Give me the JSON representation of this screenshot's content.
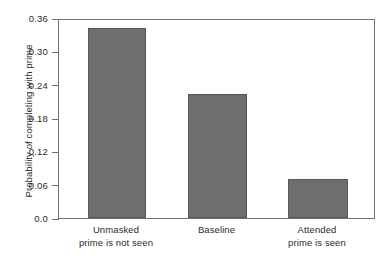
{
  "chart_data": {
    "type": "bar",
    "title": "",
    "xlabel": "",
    "ylabel": "Probability of completing with prime",
    "categories": [
      "Unmasked prime is not seen",
      "Baseline",
      "Attended prime is seen"
    ],
    "category_lines": [
      [
        "Unmasked",
        "prime is not seen"
      ],
      [
        "Baseline",
        ""
      ],
      [
        "Attended",
        "prime is seen"
      ]
    ],
    "values": [
      0.342,
      0.223,
      0.07
    ],
    "ylim": [
      0.0,
      0.36
    ],
    "yticks": [
      0.0,
      0.06,
      0.12,
      0.18,
      0.24,
      0.3,
      0.36
    ],
    "ytick_labels": [
      "0.0",
      "0.06",
      "0.12",
      "0.18",
      "0.24",
      "0.30",
      "0.36"
    ],
    "grid": false,
    "legend": false,
    "legend_position": "none",
    "bar_color": "#6e6e6e",
    "bar_edge_color": "#565656",
    "axis_color": "#6f6f6f",
    "text_color": "#2b2b2b",
    "background_color": "#ffffff"
  }
}
